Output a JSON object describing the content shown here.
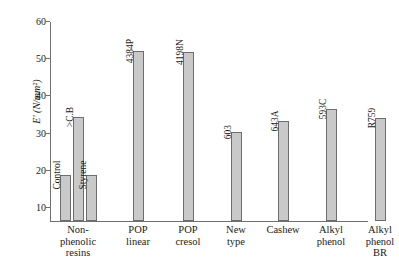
{
  "chart_data": {
    "type": "bar",
    "title": "",
    "xlabel": "",
    "ylabel": "E' (N/mm²)",
    "ylim": [
      6.5,
      60
    ],
    "yticks": [
      10,
      20,
      30,
      40,
      50,
      60
    ],
    "ytick_labels": [
      "10",
      "20",
      "30",
      "40",
      "50",
      "60"
    ],
    "grid": false,
    "legend": "none",
    "categories": [
      "Non-phenolic resins",
      "POP linear",
      "POP cresol",
      "New type",
      "Cashew",
      "Alkyl phenol",
      "Alkyl phenol BR"
    ],
    "category_lines": [
      [
        "Non-",
        "phenolic",
        "resins"
      ],
      [
        "POP",
        "linear"
      ],
      [
        "POP",
        "cresol"
      ],
      [
        "New",
        "type"
      ],
      [
        "Cashew"
      ],
      [
        "Alkyl",
        "phenol"
      ],
      [
        "Alkyl",
        "phenol",
        "BR"
      ]
    ],
    "bars": [
      {
        "group": "Non-phenolic resins",
        "label": "Control",
        "value": 19.0
      },
      {
        "group": "Non-phenolic resins",
        "label": ">C.B",
        "value": 34.5
      },
      {
        "group": "Non-phenolic resins",
        "label": "Styrene",
        "value": 19.0
      },
      {
        "group": "POP linear",
        "label": "4384P",
        "value": 52.2
      },
      {
        "group": "POP cresol",
        "label": "4198N",
        "value": 52.0
      },
      {
        "group": "New type",
        "label": "603",
        "value": 30.5
      },
      {
        "group": "Cashew",
        "label": "643A",
        "value": 33.5
      },
      {
        "group": "Alkyl phenol",
        "label": "593C",
        "value": 36.5
      },
      {
        "group": "Alkyl phenol BR",
        "label": "R759",
        "value": 34.2
      }
    ],
    "bar_color": "#c9c9c9",
    "bar_border_color": "#6d6d6d",
    "axis_color": "#6f6f6f"
  }
}
